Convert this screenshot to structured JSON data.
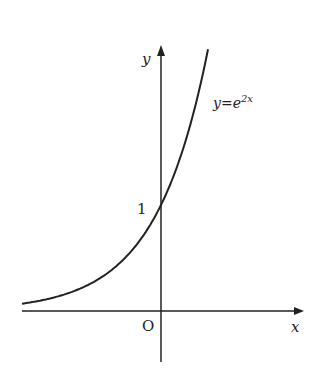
{
  "chart_data": {
    "type": "line",
    "title": "",
    "function": "y=e^{2x}",
    "series": [
      {
        "name": "y=e^{2x}",
        "x": [
          -1.3,
          -1.0,
          -0.5,
          0,
          0.25,
          0.45
        ],
        "values": [
          0.074,
          0.135,
          0.368,
          1,
          1.649,
          2.46
        ]
      }
    ],
    "xlabel": "x",
    "ylabel": "y",
    "origin_label": "O",
    "annotations": [
      {
        "text": "1",
        "at": [
          0,
          1
        ]
      },
      {
        "text": "y=e^{2x}",
        "position": "right of curve"
      }
    ],
    "grid": false,
    "xlim": [
      -1.35,
      1.35
    ],
    "ylim": [
      -0.5,
      2.5
    ]
  },
  "labels": {
    "y_axis": "y",
    "x_axis": "x",
    "origin": "O",
    "y_intercept": "1",
    "curve_base": "y=e",
    "curve_exp": "2x"
  }
}
